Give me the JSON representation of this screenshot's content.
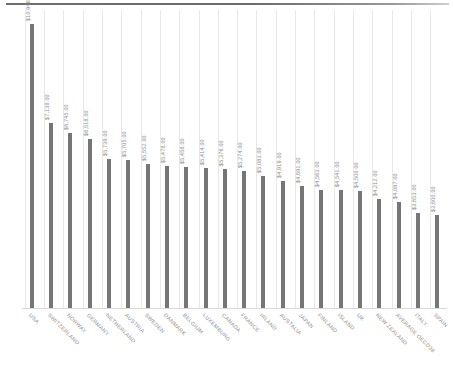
{
  "chart_data": {
    "type": "bar",
    "title": "",
    "subtitle": "",
    "xlabel": "",
    "ylabel": "",
    "ylim": [
      0,
      11500
    ],
    "grid": "vertical",
    "legend": "none",
    "orientation": "vertical",
    "bar_color": "#767676",
    "gridline_color": "#e8e8e8",
    "label_color": "#8f8f8f",
    "value_prefix": "$",
    "categories": [
      "USA",
      "SWITZERLAND",
      "NORWAY",
      "GERMANY",
      "NETHERLAND",
      "AUSTRIA",
      "SWEDEN",
      "DANMARK",
      "BELGIUM",
      "LUXEMBURG",
      "CANADA",
      "FRANCE",
      "IRLAND",
      "AUSTALIA",
      "JAPAN",
      "FINLAND",
      "ISLAND",
      "UK",
      "NEW ZEALAND",
      "AVERAGE OECD36",
      "ITALY",
      "SPAIN"
    ],
    "values": [
      10948,
      7138,
      6745,
      6518,
      5739,
      5705,
      5552,
      5478,
      5458,
      5414,
      5376,
      5274,
      5083,
      4919,
      4691,
      4563,
      4541,
      4500,
      4212,
      4087,
      3653,
      3600
    ],
    "value_labels": [
      "$10,948.00",
      "$7,138.00",
      "$6,745.00",
      "$6,518.00",
      "$5,739.00",
      "$5,705.00",
      "$5,552.00",
      "$5,478.00",
      "$5,458.00",
      "$5,414.00",
      "$5,376.00",
      "$5,274.00",
      "$5,083.00",
      "$4,919.00",
      "$4,691.00",
      "$4,563.00",
      "$4,541.00",
      "$4,500.00",
      "$4,212.00",
      "$4,087.00",
      "$3,653.00",
      "$3,600.00"
    ]
  }
}
